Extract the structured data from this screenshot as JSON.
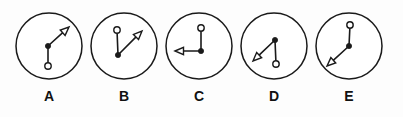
{
  "figure": {
    "kind": "vector-diagram",
    "width": 403,
    "height": 117,
    "background_color": "#fdfdfd",
    "stroke_color": "#1a1a1a",
    "label_color": "#111111"
  },
  "panels": [
    {
      "id": "A",
      "label": "A",
      "circle": {
        "cx": 49,
        "cy": 46,
        "r": 33
      },
      "open_circle": {
        "x": 48,
        "y": 66,
        "r": 3.2
      },
      "vertex": {
        "x": 48,
        "y": 46,
        "r": 2.6
      },
      "arrow_tip": {
        "x": 69,
        "y": 27
      },
      "arrow_direction": "up-right",
      "arrow_angle_deg": 42,
      "label_pos": {
        "x": 49,
        "y": 96
      }
    },
    {
      "id": "B",
      "label": "B",
      "circle": {
        "cx": 124,
        "cy": 46,
        "r": 33
      },
      "open_circle": {
        "x": 117,
        "y": 30,
        "r": 3.2
      },
      "vertex": {
        "x": 118,
        "y": 55,
        "r": 2.6
      },
      "arrow_tip": {
        "x": 142,
        "y": 31
      },
      "arrow_direction": "up-right",
      "arrow_angle_deg": 45,
      "label_pos": {
        "x": 124,
        "y": 96
      }
    },
    {
      "id": "C",
      "label": "C",
      "circle": {
        "cx": 199,
        "cy": 46,
        "r": 33
      },
      "open_circle": {
        "x": 201,
        "y": 28,
        "r": 3.2
      },
      "vertex": {
        "x": 201,
        "y": 51,
        "r": 2.6
      },
      "arrow_tip": {
        "x": 175,
        "y": 51
      },
      "arrow_direction": "left",
      "arrow_angle_deg": 180,
      "label_pos": {
        "x": 199,
        "y": 96
      }
    },
    {
      "id": "D",
      "label": "D",
      "circle": {
        "cx": 274,
        "cy": 46,
        "r": 33
      },
      "open_circle": {
        "x": 276,
        "y": 64,
        "r": 3.2
      },
      "vertex": {
        "x": 275,
        "y": 40,
        "r": 2.6
      },
      "arrow_tip": {
        "x": 253,
        "y": 61
      },
      "arrow_direction": "down-left",
      "arrow_angle_deg": 224,
      "label_pos": {
        "x": 274,
        "y": 96
      }
    },
    {
      "id": "E",
      "label": "E",
      "circle": {
        "cx": 349,
        "cy": 46,
        "r": 33
      },
      "open_circle": {
        "x": 350,
        "y": 25,
        "r": 3.2
      },
      "vertex": {
        "x": 349,
        "y": 46,
        "r": 2.6
      },
      "arrow_tip": {
        "x": 327,
        "y": 66
      },
      "arrow_direction": "down-left",
      "arrow_angle_deg": 222,
      "label_pos": {
        "x": 349,
        "y": 96
      }
    }
  ]
}
